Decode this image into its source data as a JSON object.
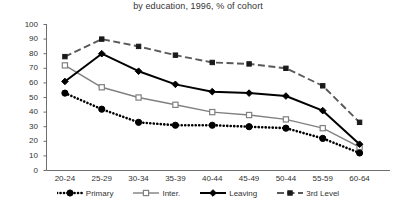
{
  "chart_data": {
    "type": "line",
    "title": "by education, 1996, % of cohort",
    "xlabel": "",
    "ylabel": "",
    "ylim": [
      0,
      100
    ],
    "ytick_step": 10,
    "yticks": [
      "100",
      "90",
      "80",
      "70",
      "60",
      "50",
      "40",
      "30",
      "20",
      "10",
      "0"
    ],
    "grid": false,
    "legend_position": "bottom",
    "categories": [
      "20-24",
      "25-29",
      "30-34",
      "35-39",
      "40-44",
      "45-49",
      "50-44",
      "55-59",
      "60-64"
    ],
    "series": [
      {
        "name": "Primary",
        "marker": "filled-circle",
        "line_style": "dotted",
        "color": "#000000",
        "values": [
          53,
          42,
          33,
          31,
          31,
          30,
          29,
          22,
          12
        ]
      },
      {
        "name": "Inter.",
        "marker": "open-square",
        "line_style": "solid",
        "color": "#808080",
        "values": [
          72,
          57,
          50,
          45,
          40,
          38,
          35,
          29,
          16
        ]
      },
      {
        "name": "Leaving",
        "marker": "filled-diamond",
        "line_style": "solid-thick",
        "color": "#000000",
        "values": [
          61,
          80,
          68,
          59,
          54,
          53,
          51,
          41,
          18
        ]
      },
      {
        "name": "3rd Level",
        "marker": "filled-square",
        "line_style": "dashed",
        "color": "#595959",
        "values": [
          78,
          90,
          85,
          79,
          74,
          73,
          70,
          58,
          33
        ]
      }
    ]
  }
}
